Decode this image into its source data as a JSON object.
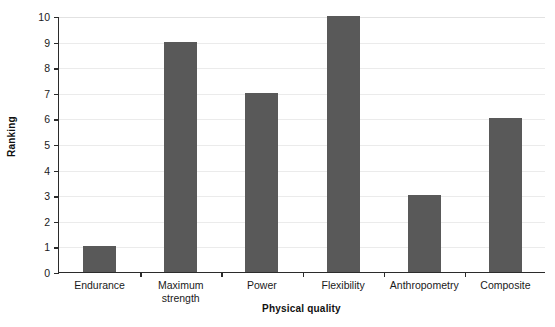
{
  "chart_data": {
    "type": "bar",
    "title": "",
    "subtitle": "",
    "xlabel": "Physical quality",
    "ylabel": "Ranking",
    "categories": [
      "Endurance",
      "Maximum\nstrength",
      "Power",
      "Flexibility",
      "Anthropometry",
      "Composite"
    ],
    "values": [
      1,
      9,
      7,
      10,
      3,
      6
    ],
    "ylim": [
      0,
      10
    ],
    "ytick_labels": [
      "0",
      "1",
      "2",
      "3",
      "4",
      "5",
      "6",
      "7",
      "8",
      "9",
      "10"
    ],
    "ytick_values": [
      0,
      1,
      2,
      3,
      4,
      5,
      6,
      7,
      8,
      9,
      10
    ],
    "grid": "horizontal",
    "legend": "none",
    "bar_color": "#595959",
    "gridline_color": "#ebebeb",
    "axis_color": "#2b2b2b",
    "background_color": "#ffffff"
  }
}
